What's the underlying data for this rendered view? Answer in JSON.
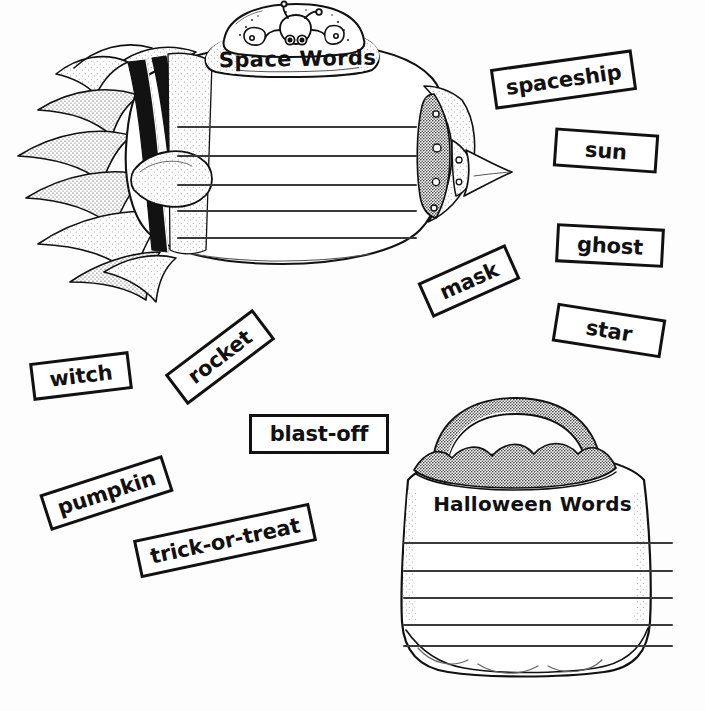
{
  "worksheet": {
    "type": "word-sort-cut-and-paste",
    "panels": [
      {
        "id": "space",
        "title": "Space Words",
        "shape": "rocket-ship",
        "writing_lines": 5
      },
      {
        "id": "halloween",
        "title": "Halloween Words",
        "shape": "trick-or-treat-bag",
        "writing_lines": 5
      }
    ]
  },
  "word_cards": [
    {
      "label": "spaceship",
      "category": "space"
    },
    {
      "label": "sun",
      "category": "space"
    },
    {
      "label": "ghost",
      "category": "halloween"
    },
    {
      "label": "star",
      "category": "space"
    },
    {
      "label": "mask",
      "category": "halloween"
    },
    {
      "label": "witch",
      "category": "halloween"
    },
    {
      "label": "rocket",
      "category": "space"
    },
    {
      "label": "blast-off",
      "category": "space"
    },
    {
      "label": "pumpkin",
      "category": "halloween"
    },
    {
      "label": "trick-or-treat",
      "category": "halloween"
    }
  ],
  "colors": {
    "ink": "#111111",
    "paper": "#ffffff",
    "rule_line": "#3a3a3a"
  }
}
